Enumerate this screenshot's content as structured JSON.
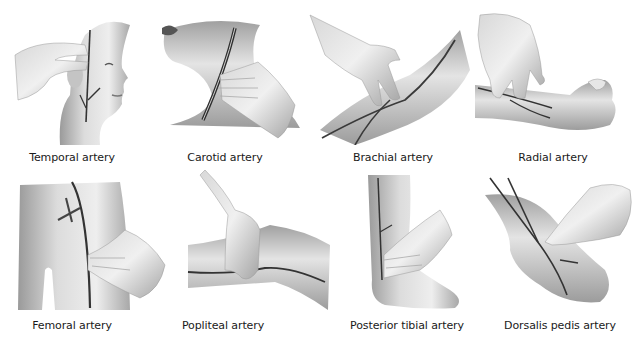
{
  "figure": {
    "panels": [
      {
        "id": "temporal",
        "label": "Temporal artery",
        "caption_x": 72,
        "caption_y": 150
      },
      {
        "id": "carotid",
        "label": "Carotid artery",
        "caption_x": 225,
        "caption_y": 150
      },
      {
        "id": "brachial",
        "label": "Brachial artery",
        "caption_x": 393,
        "caption_y": 150
      },
      {
        "id": "radial",
        "label": "Radial artery",
        "caption_x": 553,
        "caption_y": 150
      },
      {
        "id": "femoral",
        "label": "Femoral artery",
        "caption_x": 72,
        "caption_y": 318
      },
      {
        "id": "popliteal",
        "label": "Popliteal artery",
        "caption_x": 223,
        "caption_y": 318
      },
      {
        "id": "posterior_tibial",
        "label": "Posterior tibial artery",
        "caption_x": 407,
        "caption_y": 318
      },
      {
        "id": "dorsalis_pedis",
        "label": "Dorsalis pedis artery",
        "caption_x": 560,
        "caption_y": 318
      }
    ],
    "colors": {
      "skin_light": "#f2f2f2",
      "skin_mid": "#c8c8c8",
      "skin_dark": "#8c8c8c",
      "artery": "#3a3a3a",
      "caption": "#1a1a1a"
    }
  }
}
